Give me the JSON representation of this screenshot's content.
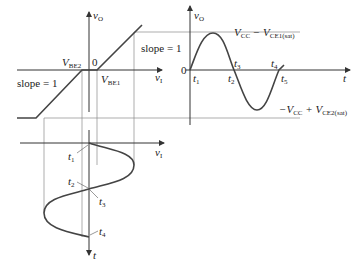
{
  "figure": {
    "transfer_plot": {
      "y_axis_label": "v",
      "y_axis_sub": "O",
      "x_axis_label": "v",
      "x_axis_sub": "I",
      "origin_label": "0",
      "vbe2_label": "V",
      "vbe2_sub": "BE2",
      "vbe1_label": "V",
      "vbe1_sub": "BE1",
      "slope_upper": "slope = 1",
      "slope_lower": "slope = 1"
    },
    "output_plot": {
      "y_axis_label": "v",
      "y_axis_sub": "O",
      "x_axis_label": "t",
      "origin_label": "0",
      "pos_sat_label_a": "V",
      "pos_sat_sub_a": "CC",
      "pos_sat_mid": " − V",
      "pos_sat_sub_b": "CE1(sat)",
      "neg_sat_label_a": "−V",
      "neg_sat_sub_a": "CC",
      "neg_sat_mid": " + V",
      "neg_sat_sub_b": "CE2(sat)",
      "time_marks": [
        {
          "t": "t",
          "sub": "1"
        },
        {
          "t": "t",
          "sub": "2"
        },
        {
          "t": "t",
          "sub": "3"
        },
        {
          "t": "t",
          "sub": "4"
        },
        {
          "t": "t",
          "sub": "5"
        }
      ]
    },
    "input_plot": {
      "x_axis_label": "v",
      "x_axis_sub": "I",
      "t_axis_label": "t",
      "time_marks": [
        {
          "t": "t",
          "sub": "1"
        },
        {
          "t": "t",
          "sub": "2"
        },
        {
          "t": "t",
          "sub": "3"
        },
        {
          "t": "t",
          "sub": "4"
        }
      ]
    },
    "colors": {
      "axis": "#333333",
      "curve": "#4a4a4a",
      "guide": "#8a8a8a",
      "text": "#222222"
    }
  }
}
